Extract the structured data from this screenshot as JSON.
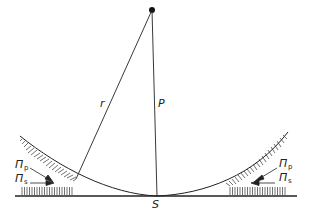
{
  "diagram": {
    "labels": {
      "r": "r",
      "P": "P",
      "S": "S",
      "pi_left": "Π",
      "pi_left_p_sub": "p",
      "pi_left_s_sub": "s",
      "pi_right": "Π",
      "pi_right_p_sub": "p",
      "pi_right_s_sub": "s"
    },
    "colors": {
      "line": "#222222",
      "background": "#ffffff"
    }
  }
}
